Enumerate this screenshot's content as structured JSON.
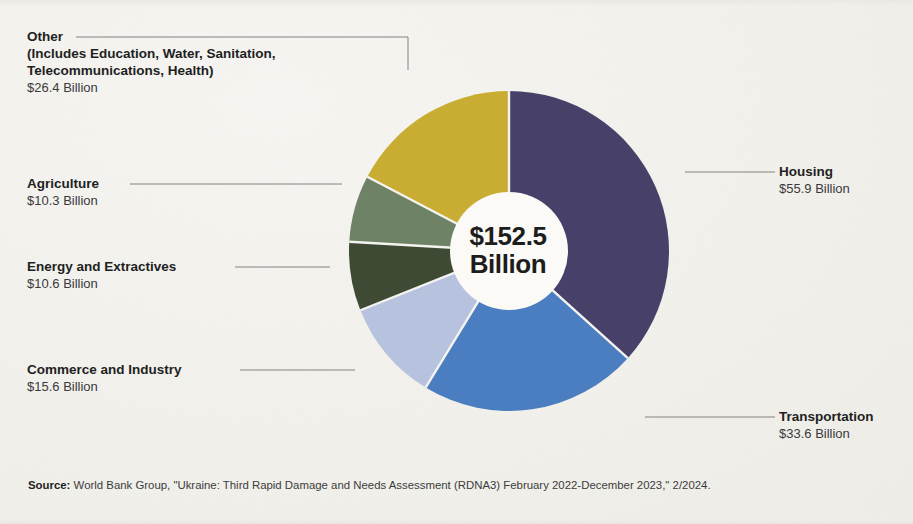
{
  "center": {
    "amount": "$152.5",
    "unit": "Billion"
  },
  "labels": {
    "other": {
      "title": "Other",
      "subtitle": "(Includes Education, Water, Sanitation, Telecommunications, Health)",
      "value": "$26.4 Billion"
    },
    "agriculture": {
      "title": "Agriculture",
      "value": "$10.3 Billion"
    },
    "energy": {
      "title": "Energy and Extractives",
      "value": "$10.6 Billion"
    },
    "commerce": {
      "title": "Commerce and Industry",
      "value": "$15.6 Billion"
    },
    "housing": {
      "title": "Housing",
      "value": "$55.9 Billion"
    },
    "transportation": {
      "title": "Transportation",
      "value": "$33.6 Billion"
    }
  },
  "source": {
    "label": "Source:",
    "text": " World Bank Group, \"Ukraine: Third Rapid Damage and Needs Assessment (RDNA3) February 2022-December 2023,\" 2/2024."
  },
  "chart_data": {
    "type": "pie",
    "title": "",
    "subtitle": "",
    "variant": "donut",
    "units": "USD billions",
    "total": 152.5,
    "total_label": "$152.5 Billion",
    "start_angle_deg": 0,
    "direction": "clockwise",
    "legend": "callout-labels",
    "grid": false,
    "categories": [
      "Housing",
      "Transportation",
      "Commerce and Industry",
      "Energy and Extractives",
      "Agriculture",
      "Other"
    ],
    "values": [
      55.9,
      33.6,
      15.6,
      10.6,
      10.3,
      26.4
    ],
    "value_labels": [
      "$55.9 Billion",
      "$33.6 Billion",
      "$15.6 Billion",
      "$10.6 Billion",
      "$10.3 Billion",
      "$26.4 Billion"
    ],
    "percentages": [
      36.7,
      22.0,
      10.2,
      7.0,
      6.8,
      17.3
    ],
    "angles_deg": [
      131.9,
      79.3,
      36.8,
      25.0,
      24.3,
      62.3
    ],
    "colors": [
      "#474169",
      "#4a7ec0",
      "#b7c3de",
      "#3e4a33",
      "#6e8265",
      "#c9ad33"
    ],
    "slice_gap_color": "#f4f3ef",
    "background": "#f4f3ef"
  }
}
